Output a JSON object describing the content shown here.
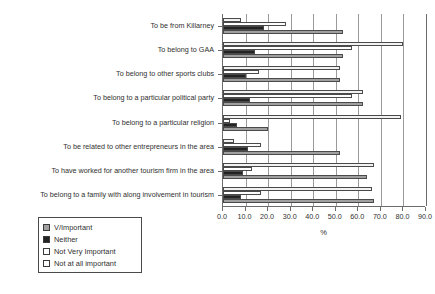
{
  "chart_data": {
    "type": "bar",
    "orientation": "horizontal",
    "title": "",
    "xlabel": "%",
    "ylabel": "",
    "xlim": [
      0.0,
      90.0
    ],
    "xticks": [
      "0.0",
      "10.0",
      "20.0",
      "30.0",
      "40.0",
      "50.0",
      "60.0",
      "70.0",
      "80.0",
      "90.0"
    ],
    "grid": "vertical",
    "legend_position": "below-left",
    "categories": [
      "To be from Killarney",
      "To belong to GAA",
      "To belong to other sports clubs",
      "To belong to a particular political party",
      "To belong to a particular religion",
      "To be related to other entrepreneurs in the area",
      "To have worked for another tourism firm in the area",
      "To belong to a family with along involvement in tourism"
    ],
    "series": [
      {
        "name": "V/Important",
        "color": "#a0a0a0",
        "values": [
          53.0,
          53.0,
          52.0,
          62.0,
          20.0,
          52.0,
          64.0,
          67.0
        ]
      },
      {
        "name": "Neither",
        "color": "#232323",
        "values": [
          18.0,
          14.0,
          10.0,
          12.0,
          6.0,
          11.0,
          9.0,
          8.0
        ]
      },
      {
        "name": "Not Very Important",
        "color": "#ffffff",
        "values": [
          28.0,
          57.0,
          16.0,
          57.0,
          3.0,
          17.0,
          13.0,
          17.0
        ]
      },
      {
        "name": "Not at all important",
        "color": "#f2f2f2",
        "values": [
          8.0,
          80.0,
          52.0,
          62.0,
          79.0,
          5.0,
          67.0,
          66.0
        ]
      }
    ]
  },
  "legend": {
    "items": [
      {
        "label": "V/Important"
      },
      {
        "label": "Neither"
      },
      {
        "label": "Not Very Important"
      },
      {
        "label": "Not at all important"
      }
    ]
  }
}
